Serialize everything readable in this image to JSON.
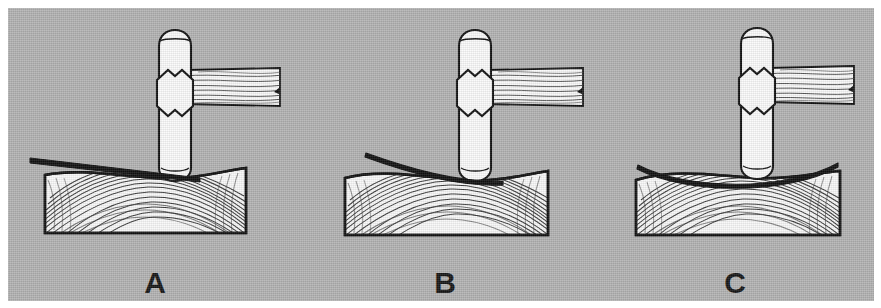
{
  "figure": {
    "name": "straightedge-check-on-wood-block",
    "background_color": "#ffffff",
    "plate_color": "#b3b3b3",
    "ink_color": "#111111",
    "white_fill": "#f7f7f7"
  },
  "panels": [
    {
      "id": "panel-a",
      "caption": "A",
      "straightedge": {
        "name": "straightedge-straight",
        "shape": "straight-tapered-bar",
        "description": "straight edge resting on the high right end of the board, gap opens toward the left"
      },
      "block": {
        "name": "wood-block",
        "surface": "concave-dished-left-of-center",
        "grain": "cathedral-arch-grain"
      },
      "tool": {
        "name": "mallet",
        "head": "rounded-cylinder-head",
        "collar": "octagonal-collar",
        "handle": "wood-grain-handle-to-right"
      }
    },
    {
      "id": "panel-b",
      "caption": "B",
      "straightedge": {
        "name": "straightedge-curved",
        "shape": "curved-bar",
        "description": "bowed edge contacting the board only at its right end"
      },
      "block": {
        "name": "wood-block",
        "surface": "crowned-then-dished",
        "grain": "cathedral-arch-grain"
      },
      "tool": {
        "name": "mallet",
        "head": "rounded-cylinder-head",
        "collar": "octagonal-collar",
        "handle": "wood-grain-handle-to-right"
      }
    },
    {
      "id": "panel-c",
      "caption": "C",
      "straightedge": {
        "name": "straightedge-arched",
        "shape": "symmetric-arc",
        "description": "edge arched evenly above the board, touching at both ends"
      },
      "block": {
        "name": "wood-block",
        "surface": "evenly-crowned",
        "grain": "cathedral-arch-grain"
      },
      "tool": {
        "name": "mallet",
        "head": "rounded-cylinder-head",
        "collar": "octagonal-collar",
        "handle": "wood-grain-handle-to-right"
      }
    }
  ]
}
